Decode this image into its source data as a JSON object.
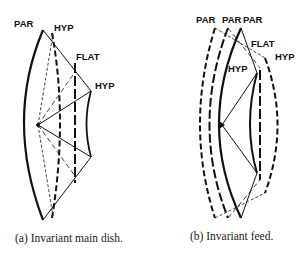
{
  "figure": {
    "panel_a": {
      "caption": "(a) Invariant main dish.",
      "labels": {
        "par": "PAR",
        "hyp_top": "HYP",
        "flat": "FLAT",
        "hyp_right": "HYP"
      }
    },
    "panel_b": {
      "caption": "(b) Invariant feed.",
      "labels": {
        "par_1": "PAR",
        "par_2": "PAR",
        "par_3": "PAR",
        "flat": "FLAT",
        "hyp_inner": "HYP",
        "hyp_outer": "HYP"
      }
    }
  },
  "colors": {
    "ink": "#111111",
    "background": "#ffffff"
  }
}
